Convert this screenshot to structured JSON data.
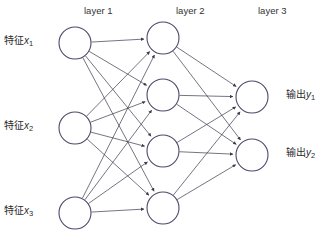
{
  "diagram": {
    "background_color": "#ffffff",
    "node_stroke_color": "#4a4a6a",
    "node_fill_color": "#ffffff",
    "edge_color": "#3a3a4a",
    "layer_titles": [
      {
        "text": "layer 1",
        "x": 84,
        "y": 6
      },
      {
        "text": "layer 2",
        "x": 176,
        "y": 6
      },
      {
        "text": "layer 3",
        "x": 258,
        "y": 6
      }
    ],
    "input_labels": [
      {
        "prefix": "特征",
        "var": "x",
        "sub": "1",
        "x": 4,
        "y": 36
      },
      {
        "prefix": "特征",
        "var": "x",
        "sub": "2",
        "x": 4,
        "y": 121
      },
      {
        "prefix": "特征",
        "var": "x",
        "sub": "3",
        "x": 4,
        "y": 206
      }
    ],
    "output_labels": [
      {
        "prefix": "输出",
        "var": "y",
        "sub": "1",
        "x": 286,
        "y": 90
      },
      {
        "prefix": "输出",
        "var": "y",
        "sub": "2",
        "x": 286,
        "y": 148
      }
    ],
    "layers": [
      {
        "name": "layer-1",
        "radius": 16,
        "nodes": [
          {
            "id": "l1n1",
            "cx": 75,
            "cy": 43
          },
          {
            "id": "l1n2",
            "cx": 75,
            "cy": 128
          },
          {
            "id": "l1n3",
            "cx": 75,
            "cy": 213
          }
        ]
      },
      {
        "name": "layer-2",
        "radius": 16,
        "nodes": [
          {
            "id": "l2n1",
            "cx": 163,
            "cy": 38
          },
          {
            "id": "l2n2",
            "cx": 163,
            "cy": 95
          },
          {
            "id": "l2n3",
            "cx": 163,
            "cy": 151
          },
          {
            "id": "l2n4",
            "cx": 163,
            "cy": 208
          }
        ]
      },
      {
        "name": "layer-3",
        "radius": 16,
        "nodes": [
          {
            "id": "l3n1",
            "cx": 252,
            "cy": 97
          },
          {
            "id": "l3n2",
            "cx": 252,
            "cy": 155
          }
        ]
      }
    ],
    "connections": [
      {
        "from": "l1n1",
        "to": "l2n1"
      },
      {
        "from": "l1n1",
        "to": "l2n2"
      },
      {
        "from": "l1n1",
        "to": "l2n3"
      },
      {
        "from": "l1n1",
        "to": "l2n4"
      },
      {
        "from": "l1n2",
        "to": "l2n1"
      },
      {
        "from": "l1n2",
        "to": "l2n2"
      },
      {
        "from": "l1n2",
        "to": "l2n3"
      },
      {
        "from": "l1n2",
        "to": "l2n4"
      },
      {
        "from": "l1n3",
        "to": "l2n1"
      },
      {
        "from": "l1n3",
        "to": "l2n2"
      },
      {
        "from": "l1n3",
        "to": "l2n3"
      },
      {
        "from": "l1n3",
        "to": "l2n4"
      },
      {
        "from": "l2n1",
        "to": "l3n1"
      },
      {
        "from": "l2n1",
        "to": "l3n2"
      },
      {
        "from": "l2n2",
        "to": "l3n1"
      },
      {
        "from": "l2n2",
        "to": "l3n2"
      },
      {
        "from": "l2n3",
        "to": "l3n1"
      },
      {
        "from": "l2n3",
        "to": "l3n2"
      },
      {
        "from": "l2n4",
        "to": "l3n1"
      },
      {
        "from": "l2n4",
        "to": "l3n2"
      }
    ],
    "caption": ""
  }
}
